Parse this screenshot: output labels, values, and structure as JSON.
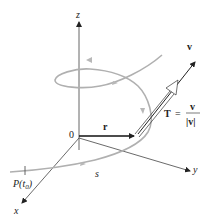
{
  "diagram": {
    "axes": {
      "z_label": "z",
      "y_label": "y",
      "x_label": "x",
      "origin_label": "0"
    },
    "vectors": {
      "r_label": "r",
      "v_label": "v",
      "tangent_label_T": "T",
      "tangent_label_equals": "=",
      "tangent_label_num": "v",
      "tangent_label_den": "|v|"
    },
    "curve": {
      "start_point_label": "P(t",
      "start_point_subscript": "0",
      "start_point_close": ")",
      "arc_length_label": "s"
    },
    "colors": {
      "axis": "#333333",
      "curve": "#a8a8a8",
      "vector": "#111111"
    }
  }
}
